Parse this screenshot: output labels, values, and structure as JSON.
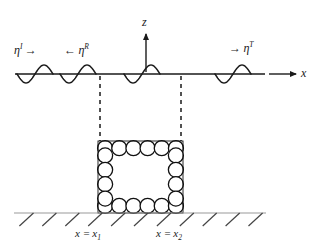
{
  "figure": {
    "type": "wave-scattering-schematic",
    "background_color": "#ffffff",
    "stroke_color": "#1a1a1a",
    "hatch_color": "#444444"
  },
  "axes": {
    "vertical": {
      "label": "z",
      "arrow": "up",
      "x": 146,
      "y_top": 30,
      "y_bottom": 72
    },
    "horizontal": {
      "label": "x",
      "arrow": "right",
      "y": 74,
      "x_start": 269,
      "x_end": 296
    }
  },
  "free_surface": {
    "name": "still-water-line",
    "y": 74,
    "x_start": 15,
    "x_end": 265
  },
  "waves": {
    "incident": {
      "symbol": "η",
      "superscript": "I",
      "arrow": "→",
      "arrow_direction": "right",
      "label_x": 14,
      "label_y": 43
    },
    "reflected": {
      "symbol": "η",
      "superscript": "R",
      "arrow": "←",
      "arrow_direction": "left",
      "label_x": 64,
      "label_y": 43
    },
    "transmitted": {
      "symbol": "η",
      "superscript": "T",
      "arrow": "→",
      "arrow_direction": "right",
      "label_x": 229,
      "label_y": 41
    }
  },
  "wave_packets": [
    {
      "x": 17,
      "name": "wave-packet-incident-1"
    },
    {
      "x": 60,
      "name": "wave-packet-incident-2"
    },
    {
      "x": 124,
      "name": "wave-packet-interior"
    },
    {
      "x": 215,
      "name": "wave-packet-transmitted"
    }
  ],
  "boundaries": {
    "left": {
      "name": "boundary-x1",
      "x": 100,
      "y_top": 76,
      "y_bottom": 141,
      "label_prefix": "x =",
      "label_symbol": "x",
      "label_subscript": "1",
      "label_x": 75,
      "label_y": 228
    },
    "right": {
      "name": "boundary-x2",
      "x": 181,
      "y_top": 76,
      "y_bottom": 141,
      "label_prefix": "x =",
      "label_symbol": "x",
      "label_subscript": "2",
      "label_x": 156,
      "label_y": 228
    }
  },
  "structure": {
    "name": "porous-sphere-array",
    "left": 98,
    "right": 183,
    "top": 141,
    "bottom": 213,
    "circle_radius": 7.5,
    "columns": 6,
    "rows": 5,
    "fill": "#ffffff",
    "stroke": "#111111"
  },
  "seabed": {
    "name": "seabed-line",
    "y": 213,
    "x_start": 14,
    "x_end": 266,
    "hatch_count": 11,
    "hatch_length": 18,
    "hatch_angle_deg": 45
  }
}
